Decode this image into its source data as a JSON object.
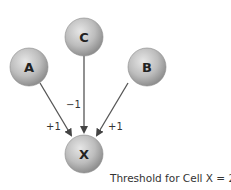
{
  "diagram": {
    "nodes": [
      {
        "id": "A",
        "label": "A",
        "cx": 29,
        "cy": 67
      },
      {
        "id": "C",
        "label": "C",
        "cx": 84,
        "cy": 37
      },
      {
        "id": "B",
        "label": "B",
        "cx": 147,
        "cy": 67
      },
      {
        "id": "X",
        "label": "X",
        "cx": 84,
        "cy": 154
      }
    ],
    "edges": [
      {
        "from": "A",
        "to": "X",
        "weight": "+1"
      },
      {
        "from": "C",
        "to": "X",
        "weight": "−1"
      },
      {
        "from": "B",
        "to": "X",
        "weight": "+1"
      }
    ],
    "caption": "Threshold for Cell X = 2",
    "colors": {
      "node_fill": "#b8b8b8",
      "node_stroke": "#7a7a7a",
      "edge": "#444444",
      "text": "#222222"
    }
  }
}
